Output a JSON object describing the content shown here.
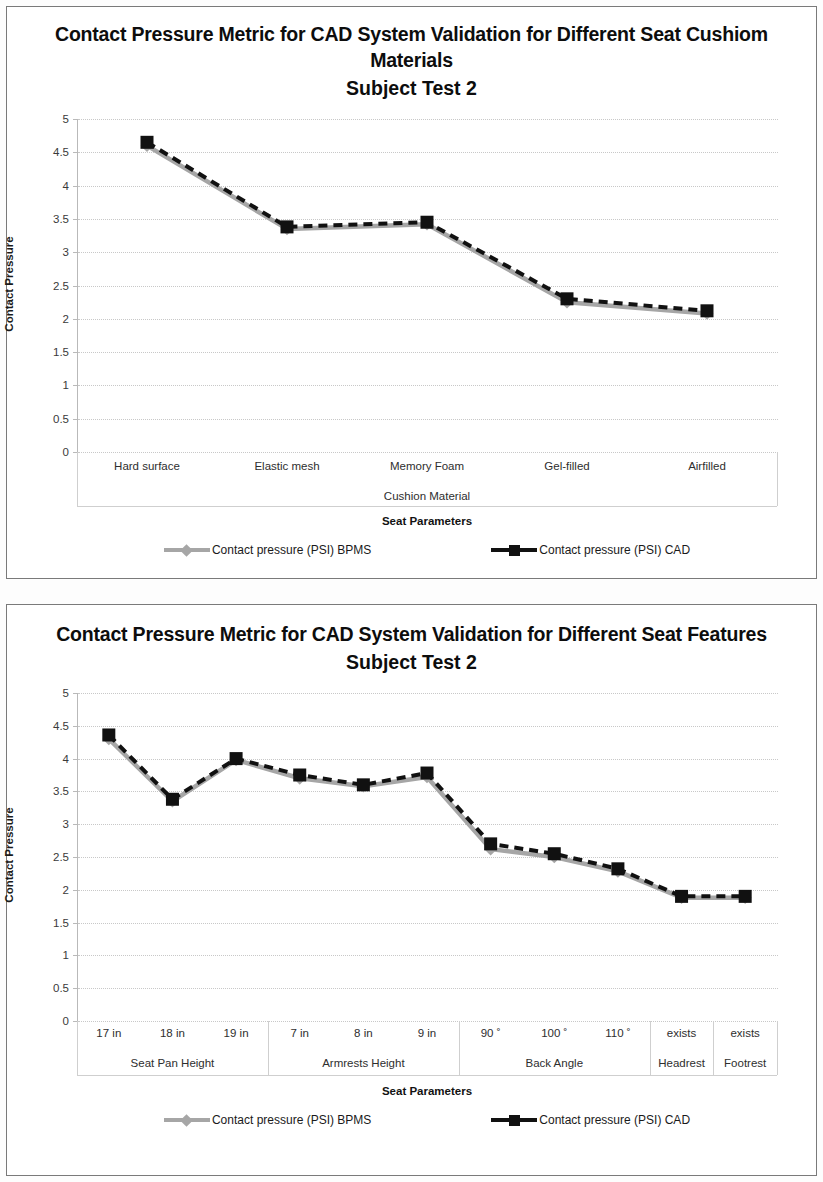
{
  "page": {
    "background": "#fdfdfd",
    "border_color": "#7a7a7a"
  },
  "colors": {
    "bpms": "#a6a6a6",
    "cad": "#111111",
    "gridline": "#c8c8c8",
    "axis": "#b9b9b9"
  },
  "legend": {
    "bpms_label": "Contact pressure (PSI) BPMS",
    "cad_label": "Contact pressure (PSI) CAD",
    "bpms_icon": "gray-line-diamond-marker",
    "cad_icon": "black-line-square-marker"
  },
  "chart1": {
    "title": "Contact Pressure Metric for CAD System Validation for Different Seat Cushiom Materials",
    "subtitle": "Subject Test 2"
  },
  "chart2": {
    "title": "Contact Pressure Metric for CAD System Validation for Different Seat Features",
    "subtitle": "Subject Test 2"
  },
  "chart_data": [
    {
      "type": "line",
      "title": "Contact Pressure Metric for CAD System Validation for Different Seat Cushiom Materials",
      "subtitle": "Subject Test 2",
      "xlabel": "Seat Parameters",
      "ylabel": "Contact Pressure",
      "ylim": [
        0,
        5
      ],
      "yticks": [
        "0",
        "0.5",
        "1",
        "1.5",
        "2",
        "2.5",
        "3",
        "3.5",
        "4",
        "4.5",
        "5"
      ],
      "ytick_values": [
        0,
        0.5,
        1,
        1.5,
        2,
        2.5,
        3,
        3.5,
        4,
        4.5,
        5
      ],
      "grid": true,
      "legend_position": "bottom",
      "categories": [
        "Hard surface",
        "Elastic mesh",
        "Memory Foam",
        "Gel-filled",
        "Airfilled"
      ],
      "group_label": "Cushion Material",
      "groups": [
        {
          "label": "Cushion Material",
          "span": 5
        }
      ],
      "series": [
        {
          "name": "Contact pressure (PSI) BPMS",
          "color": "#a6a6a6",
          "marker": "diamond",
          "values": [
            4.6,
            3.35,
            3.42,
            2.25,
            2.08
          ]
        },
        {
          "name": "Contact pressure (PSI) CAD",
          "color": "#111111",
          "marker": "square",
          "values": [
            4.65,
            3.38,
            3.45,
            2.3,
            2.12
          ]
        }
      ]
    },
    {
      "type": "line",
      "title": "Contact Pressure Metric for CAD System Validation for Different Seat Features",
      "subtitle": "Subject Test 2",
      "xlabel": "Seat Parameters",
      "ylabel": "Contact Pressure",
      "ylim": [
        0,
        5
      ],
      "yticks": [
        "0",
        "0.5",
        "1",
        "1.5",
        "2",
        "2.5",
        "3",
        "3.5",
        "4",
        "4.5",
        "5"
      ],
      "ytick_values": [
        0,
        0.5,
        1,
        1.5,
        2,
        2.5,
        3,
        3.5,
        4,
        4.5,
        5
      ],
      "grid": true,
      "legend_position": "bottom",
      "categories": [
        "17 in",
        "18 in",
        "19 in",
        "7 in",
        "8 in",
        "9 in",
        "90 ˚",
        "100 ˚",
        "110 ˚",
        "exists",
        "exists"
      ],
      "groups": [
        {
          "label": "Seat Pan Height",
          "span": 3
        },
        {
          "label": "Armrests Height",
          "span": 3
        },
        {
          "label": "Back Angle",
          "span": 3
        },
        {
          "label": "Headrest",
          "span": 1
        },
        {
          "label": "Footrest",
          "span": 1
        }
      ],
      "series": [
        {
          "name": "Contact pressure (PSI) BPMS",
          "color": "#a6a6a6",
          "marker": "diamond",
          "values": [
            4.3,
            3.35,
            3.98,
            3.7,
            3.58,
            3.72,
            2.62,
            2.5,
            2.28,
            1.88,
            1.88
          ]
        },
        {
          "name": "Contact pressure (PSI) CAD",
          "color": "#111111",
          "marker": "square",
          "values": [
            4.36,
            3.38,
            4.0,
            3.75,
            3.6,
            3.78,
            2.7,
            2.55,
            2.32,
            1.9,
            1.9
          ]
        }
      ]
    }
  ]
}
